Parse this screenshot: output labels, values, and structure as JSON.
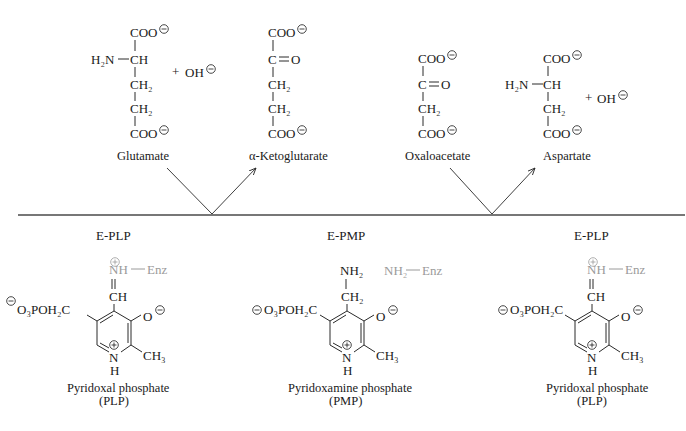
{
  "figure": {
    "colors": {
      "ink": "#1a1a1a",
      "enzyme_gray": "#9a9a9a",
      "baseline": "#4a4a4a"
    }
  },
  "top": {
    "glutamate": {
      "name": "Glutamate",
      "atoms": [
        "COO",
        "H₂N",
        "CH",
        "CH₂",
        "CH₂",
        "COO"
      ],
      "plus": "+",
      "oh": "OH"
    },
    "ketoglutarate": {
      "name": "α-Ketoglutarate",
      "atoms": [
        "COO",
        "C",
        "O",
        "CH₂",
        "CH₂",
        "COO"
      ]
    },
    "oxaloacetate": {
      "name": "Oxaloacetate",
      "atoms": [
        "COO",
        "C",
        "O",
        "CH₂",
        "COO"
      ]
    },
    "aspartate": {
      "name": "Aspartate",
      "atoms": [
        "COO",
        "H₂N",
        "CH",
        "CH₂",
        "COO"
      ],
      "plus": "+",
      "oh": "OH"
    }
  },
  "bottom": {
    "left": {
      "state": "E-PLP",
      "name": "Pyridoxal phosphate",
      "abbr": "(PLP)",
      "link": {
        "nh": "NH",
        "enz": "Enz"
      },
      "c4_group": "CH",
      "phosphate": "O₃POH₂C",
      "phosphate_charge": "2−",
      "oxide": "O",
      "methyl": "CH₃",
      "ring_n": "N",
      "ring_h": "H"
    },
    "middle": {
      "state": "E-PMP",
      "name": "Pyridoxamine phosphate",
      "abbr": "(PMP)",
      "amine": "NH₂",
      "c4_group": "CH₂",
      "free_enzyme": {
        "nh2": "NH₂",
        "enz": "Enz"
      },
      "phosphate": "O₃POH₂C",
      "phosphate_charge": "2−",
      "oxide": "O",
      "methyl": "CH₃",
      "ring_n": "N",
      "ring_h": "H"
    },
    "right": {
      "state": "E-PLP",
      "name": "Pyridoxal phosphate",
      "abbr": "(PLP)",
      "link": {
        "nh": "NH",
        "enz": "Enz"
      },
      "c4_group": "CH",
      "phosphate": "O₃POH₂C",
      "phosphate_charge": "2−",
      "oxide": "O",
      "methyl": "CH₃",
      "ring_n": "N",
      "ring_h": "H"
    }
  }
}
